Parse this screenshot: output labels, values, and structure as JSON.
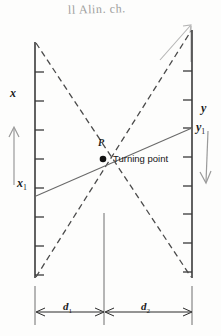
{
  "figure": {
    "handwritten_note": "ll Alin. ch.",
    "labels": {
      "left_axis": "x",
      "left_axis_lower": "x",
      "left_axis_lower_sub": "1",
      "right_axis": "y",
      "right_axis_point": "y",
      "right_axis_point_sub": "1",
      "point_marker": "P",
      "turning_point": "Turning point",
      "dim_left": "d",
      "dim_left_sub": "1",
      "dim_right": "d",
      "dim_right_sub": "2"
    },
    "colors": {
      "ink": "#1b1b1b",
      "axis": "#3a3a3a",
      "dashed": "#4a4a4a",
      "thin_line": "#6a6a6a",
      "pencil": "#9a9a9a",
      "paper": "#fdfdfc"
    },
    "geometry": {
      "left_axis_x": 35,
      "left_axis_top": 42,
      "left_axis_bottom": 278,
      "right_axis_x": 192,
      "right_axis_top": 30,
      "right_axis_bottom": 278,
      "center_x": 104,
      "turning_point_x": 103,
      "turning_point_y": 159,
      "dimension_line_y": 312,
      "left_tick_count": 8,
      "right_tick_count": 8
    }
  }
}
